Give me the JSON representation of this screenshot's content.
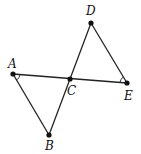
{
  "figure": {
    "points": {
      "A": {
        "label": "A",
        "x": 13,
        "y": 74,
        "lx": 8,
        "ly": 68
      },
      "B": {
        "label": "B",
        "x": 49,
        "y": 135,
        "lx": 45,
        "ly": 150
      },
      "C": {
        "label": "C",
        "x": 70,
        "y": 79,
        "lx": 67,
        "ly": 95
      },
      "D": {
        "label": "D",
        "x": 91,
        "y": 23,
        "lx": 86,
        "ly": 15
      },
      "E": {
        "label": "E",
        "x": 127,
        "y": 83,
        "lx": 124,
        "ly": 100
      }
    },
    "segments": [
      "AE",
      "AB",
      "BD",
      "DE"
    ],
    "angle_marks": [
      "A",
      "E"
    ]
  }
}
